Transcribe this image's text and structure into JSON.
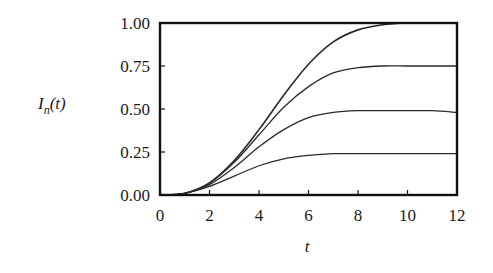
{
  "chart_data": {
    "type": "line",
    "title": "",
    "xlabel": "t",
    "ylabel": "I_n(t)",
    "xlim": [
      0,
      12
    ],
    "ylim": [
      0,
      1
    ],
    "grid": false,
    "legend": null,
    "x_ticks": [
      0,
      2,
      4,
      6,
      8,
      10,
      12
    ],
    "x_tick_labels": [
      "0",
      "2",
      "4",
      "6",
      "8",
      "10",
      "12"
    ],
    "y_ticks": [
      0,
      0.25,
      0.5,
      0.75,
      1.0
    ],
    "y_tick_labels": [
      "0.00",
      "0.25",
      "0.50",
      "0.75",
      "1.00"
    ],
    "x": [
      0,
      1,
      2,
      3,
      4,
      5,
      6,
      7,
      8,
      9,
      10,
      11,
      12
    ],
    "series": [
      {
        "name": "curve-1.00",
        "values": [
          0,
          0.01,
          0.07,
          0.2,
          0.38,
          0.58,
          0.76,
          0.89,
          0.96,
          0.99,
          1.0,
          1.0,
          1.0
        ]
      },
      {
        "name": "curve-0.75",
        "values": [
          0,
          0.01,
          0.07,
          0.19,
          0.35,
          0.51,
          0.63,
          0.71,
          0.74,
          0.75,
          0.75,
          0.75,
          0.75
        ]
      },
      {
        "name": "curve-0.50",
        "values": [
          0,
          0.01,
          0.06,
          0.16,
          0.28,
          0.38,
          0.45,
          0.48,
          0.49,
          0.49,
          0.49,
          0.49,
          0.48
        ]
      },
      {
        "name": "curve-0.25",
        "values": [
          0,
          0.01,
          0.05,
          0.11,
          0.17,
          0.21,
          0.23,
          0.24,
          0.24,
          0.24,
          0.24,
          0.24,
          0.24
        ]
      }
    ],
    "line_color": "#2a2a2a",
    "axis_color": "#111111"
  },
  "labels": {
    "y_axis_main": "I",
    "y_axis_sub": "n",
    "y_axis_arg": "(t)",
    "x_axis": "t"
  }
}
